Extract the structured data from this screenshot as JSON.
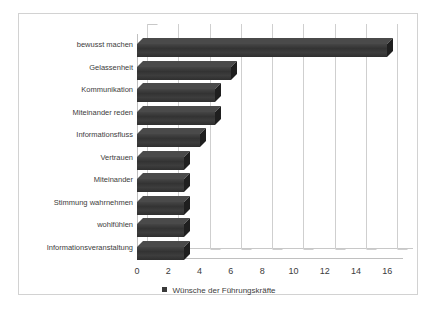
{
  "chart_data": {
    "type": "bar",
    "orientation": "horizontal",
    "title": "",
    "xlabel": "",
    "ylabel": "",
    "xlim": [
      0,
      17
    ],
    "xticks": [
      0,
      2,
      4,
      6,
      8,
      10,
      12,
      14,
      16
    ],
    "grid": true,
    "legend_position": "bottom",
    "categories": [
      "bewusst machen",
      "Gelassenheit",
      "Kommunikation",
      "Miteinander reden",
      "Informationsfluss",
      "Vertrauen",
      "Miteinander",
      "Stimmung wahrnehmen",
      "wohlfühlen",
      "Informationsveranstaltung"
    ],
    "series": [
      {
        "name": "Wünsche der Führungskräfte",
        "values": [
          16,
          6,
          5,
          5,
          4,
          3,
          3,
          3,
          3,
          3
        ],
        "color": "#3a3a3a"
      }
    ]
  },
  "legend": {
    "marker": "square-marker",
    "label": "Wünsche der Führungskräfte"
  },
  "colors": {
    "bar": "#3a3a3a",
    "bar_top": "#4a4a4a",
    "bar_side": "#1f1f1f",
    "gridline": "#cfcfcf",
    "axis": "#c0c0c0",
    "border": "#d2d2d2",
    "text": "#3c3c3c",
    "background": "#ffffff"
  }
}
